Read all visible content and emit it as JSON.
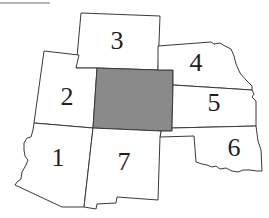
{
  "map": {
    "highlight_color": "#8a8a8a",
    "border_color": "#3a3a3a",
    "background_color": "#ffffff",
    "regions": [
      {
        "id": "1",
        "label": "1"
      },
      {
        "id": "2",
        "label": "2"
      },
      {
        "id": "3",
        "label": "3"
      },
      {
        "id": "4",
        "label": "4"
      },
      {
        "id": "5",
        "label": "5"
      },
      {
        "id": "6",
        "label": "6"
      },
      {
        "id": "7",
        "label": "7"
      },
      {
        "id": "center",
        "label": "",
        "highlighted": true
      }
    ]
  }
}
